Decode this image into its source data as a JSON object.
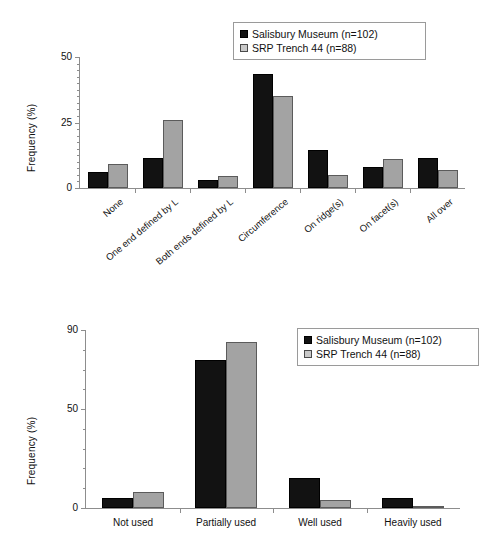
{
  "figure": {
    "background": "#ffffff",
    "series_colors": {
      "salisbury": "#121212",
      "srp": "#a3a3a3"
    }
  },
  "legend": {
    "position": "top-right",
    "entries": [
      {
        "label": "Salisbury Museum (n=102)",
        "swatch": "black-square-icon"
      },
      {
        "label": "SRP Trench 44 (n=88)",
        "swatch": "gray-square-icon"
      }
    ]
  },
  "chart_data": [
    {
      "type": "bar",
      "id": "top",
      "title": "",
      "xlabel": "",
      "ylabel": "Frequency (%)",
      "ylim": [
        0,
        50
      ],
      "yticks": [
        0,
        25,
        50
      ],
      "ytick_labels": [
        "0",
        "25",
        "50"
      ],
      "grid": false,
      "legend_position": "top-right",
      "categories": [
        "None",
        "One end defined by L",
        "Both ends defined by L",
        "Circumference",
        "On ridge(s)",
        "On facet(s)",
        "All over"
      ],
      "series": [
        {
          "name": "Salisbury Museum (n=102)",
          "values": [
            6,
            11.5,
            3,
            43.5,
            14.5,
            8,
            11.5
          ]
        },
        {
          "name": "SRP Trench 44 (n=88)",
          "values": [
            9,
            26,
            4.5,
            35,
            5,
            11,
            7
          ]
        }
      ]
    },
    {
      "type": "bar",
      "id": "bottom",
      "title": "",
      "xlabel": "",
      "ylabel": "Frequency (%)",
      "ylim": [
        0,
        90
      ],
      "yticks": [
        0,
        50,
        90
      ],
      "ytick_labels": [
        "0",
        "50",
        "90"
      ],
      "grid": false,
      "legend_position": "top-right",
      "categories": [
        "Not used",
        "Partially used",
        "Well used",
        "Heavily used"
      ],
      "series": [
        {
          "name": "Salisbury Museum (n=102)",
          "values": [
            5,
            75,
            15,
            5
          ]
        },
        {
          "name": "SRP Trench 44 (n=88)",
          "values": [
            8,
            84,
            4,
            1
          ]
        }
      ]
    }
  ]
}
